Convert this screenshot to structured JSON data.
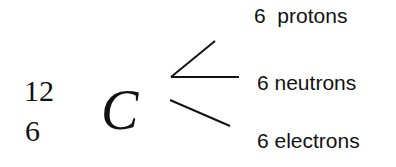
{
  "isotope": {
    "mass_number": "12",
    "atomic_number": "6",
    "symbol": "C"
  },
  "particles": [
    {
      "label": "6  protons"
    },
    {
      "label": "6 neutrons"
    },
    {
      "label": "6 electrons"
    }
  ],
  "colors": {
    "text": "#111111",
    "lines": "#111111",
    "background": "#ffffff"
  }
}
